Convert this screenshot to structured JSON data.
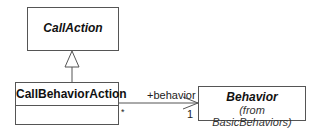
{
  "diagram": {
    "type": "UML class diagram",
    "classes": [
      {
        "id": "callaction",
        "name": "CallAction",
        "abstract": true
      },
      {
        "id": "callbehavioraction",
        "name": "CallBehaviorAction",
        "abstract": false
      },
      {
        "id": "behavior",
        "name": "Behavior",
        "abstract": true,
        "package_note": "(from BasicBehaviors)"
      }
    ],
    "relations": [
      {
        "type": "generalization",
        "from": "CallBehaviorAction",
        "to": "CallAction"
      },
      {
        "type": "association",
        "from": "CallBehaviorAction",
        "to": "Behavior",
        "role": "+behavior",
        "source_multiplicity": "*",
        "target_multiplicity": "1",
        "navigable": true
      }
    ]
  }
}
